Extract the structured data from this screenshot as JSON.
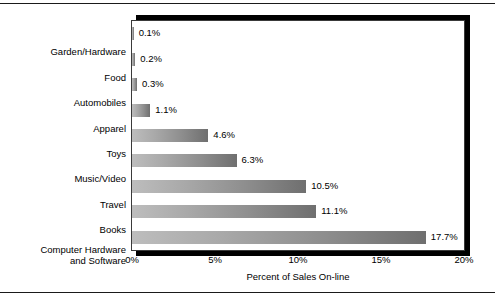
{
  "chart_data": {
    "type": "bar",
    "orientation": "horizontal",
    "title": "",
    "xlabel": "Percent of Sales On-line",
    "ylabel": "",
    "xlim": [
      0,
      20
    ],
    "grid": false,
    "legend": false,
    "xticks": [
      "0%",
      "5%",
      "10%",
      "15%",
      "20%"
    ],
    "xtick_values": [
      0,
      5,
      10,
      15,
      20
    ],
    "categories": [
      "Garden/Hardware",
      "Food",
      "Automobiles",
      "Apparel",
      "Toys",
      "Music/Video",
      "Travel",
      "Books",
      "Computer Hardware\nand Software"
    ],
    "values": [
      0.1,
      0.2,
      0.3,
      1.1,
      4.6,
      6.3,
      10.5,
      11.1,
      17.7
    ],
    "value_labels": [
      "0.1%",
      "0.2%",
      "0.3%",
      "1.1%",
      "4.6%",
      "6.3%",
      "10.5%",
      "11.1%",
      "17.7%"
    ],
    "colors": {
      "bar_gradient_start": "#bdbdbd",
      "bar_gradient_end": "#6f6f6f",
      "frame": "#3a3a3a",
      "shadow": "#000000",
      "text": "#000000",
      "background": "#ffffff"
    }
  }
}
